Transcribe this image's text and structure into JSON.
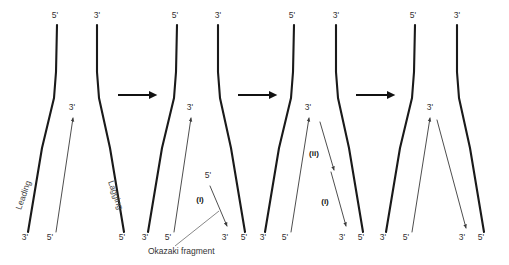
{
  "figure": {
    "width": 509,
    "height": 265,
    "background": "#ffffff",
    "colors": {
      "parent_strand": "#1a1a1a",
      "new_strand": "#3a3a3a",
      "label_text": "#333333",
      "bold_label_text": "#111111",
      "transition_arrow": "#111111"
    }
  },
  "labels": {
    "five_prime": "5'",
    "three_prime": "3'",
    "leading": "Leading",
    "lagging": "Lagging",
    "okazaki": "Okazaki fragment",
    "step_one": "(i)",
    "step_two": "(ii)"
  },
  "panels": [
    {
      "id": "panel-1",
      "name": "replication-fork-stage-1",
      "top_labels": [
        {
          "text": "5'",
          "x": 55,
          "y": 18
        },
        {
          "text": "3'",
          "x": 97,
          "y": 18
        }
      ],
      "bottom_labels": [
        {
          "text": "3'",
          "x": 25,
          "y": 240
        },
        {
          "text": "5'",
          "x": 50,
          "y": 240
        },
        {
          "text": "5'",
          "x": 122,
          "y": 240
        }
      ],
      "arrow_labels": [
        {
          "text": "3'",
          "x": 72,
          "y": 110
        }
      ],
      "strand_names": [
        {
          "text": "Leading",
          "x": 26,
          "y": 196,
          "rotate": -71
        },
        {
          "text": "Lagging",
          "x": 113,
          "y": 196,
          "rotate": 71
        }
      ]
    },
    {
      "id": "panel-2",
      "name": "replication-fork-stage-2",
      "top_labels": [
        {
          "text": "5'",
          "x": 175,
          "y": 18
        },
        {
          "text": "3'",
          "x": 218,
          "y": 18
        }
      ],
      "bottom_labels": [
        {
          "text": "3'",
          "x": 145,
          "y": 240
        },
        {
          "text": "5'",
          "x": 168,
          "y": 240
        },
        {
          "text": "3'",
          "x": 225,
          "y": 240
        },
        {
          "text": "5'",
          "x": 244,
          "y": 240
        }
      ],
      "arrow_labels": [
        {
          "text": "3'",
          "x": 190,
          "y": 110
        },
        {
          "text": "5'",
          "x": 208,
          "y": 178
        }
      ],
      "step_labels": [
        {
          "text": "(i)",
          "x": 200,
          "y": 202
        }
      ],
      "caption": {
        "text": "Okazaki fragment",
        "x": 148,
        "y": 254
      }
    },
    {
      "id": "panel-3",
      "name": "replication-fork-stage-3",
      "top_labels": [
        {
          "text": "5'",
          "x": 292,
          "y": 18
        },
        {
          "text": "3'",
          "x": 336,
          "y": 18
        }
      ],
      "bottom_labels": [
        {
          "text": "3'",
          "x": 263,
          "y": 240
        },
        {
          "text": "5'",
          "x": 285,
          "y": 240
        },
        {
          "text": "3'",
          "x": 342,
          "y": 240
        },
        {
          "text": "5'",
          "x": 361,
          "y": 240
        }
      ],
      "arrow_labels": [
        {
          "text": "3'",
          "x": 308,
          "y": 110
        }
      ],
      "step_labels": [
        {
          "text": "(ii)",
          "x": 314,
          "y": 156
        },
        {
          "text": "(i)",
          "x": 325,
          "y": 204
        }
      ]
    },
    {
      "id": "panel-4",
      "name": "replication-fork-stage-4",
      "top_labels": [
        {
          "text": "5'",
          "x": 413,
          "y": 18
        },
        {
          "text": "3'",
          "x": 457,
          "y": 18
        }
      ],
      "bottom_labels": [
        {
          "text": "3'",
          "x": 383,
          "y": 240
        },
        {
          "text": "5'",
          "x": 406,
          "y": 240
        },
        {
          "text": "3'",
          "x": 462,
          "y": 240
        },
        {
          "text": "5'",
          "x": 481,
          "y": 240
        }
      ],
      "arrow_labels": [
        {
          "text": "3'",
          "x": 430,
          "y": 110
        }
      ]
    }
  ],
  "transition_arrows": [
    {
      "name": "arrow-panel1-to-panel2",
      "x1": 118,
      "y1": 95,
      "x2": 158,
      "y2": 95
    },
    {
      "name": "arrow-panel2-to-panel3",
      "x1": 238,
      "y1": 95,
      "x2": 278,
      "y2": 95
    },
    {
      "name": "arrow-panel3-to-panel4",
      "x1": 356,
      "y1": 95,
      "x2": 396,
      "y2": 95
    }
  ]
}
